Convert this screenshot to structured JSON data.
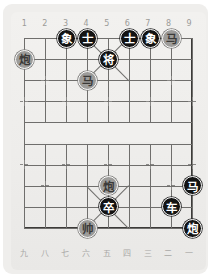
{
  "board": {
    "title": "Xiangqi Board",
    "columns": 9,
    "rows": 10,
    "colors": {
      "card_background": "#efeeec",
      "paper_background": "#f1f0ee",
      "grid_line": "#6f6e6c",
      "frame": "#3c3b39",
      "black_piece_fill": "#131313",
      "black_piece_text": "#ffffff",
      "grey_piece_fill": "#9d9c9a",
      "grey_piece_text": "#3b3a38",
      "coord_text": "#9c9b99"
    },
    "coords_top": [
      "1",
      "2",
      "3",
      "4",
      "5",
      "6",
      "7",
      "8",
      "9"
    ],
    "coords_bottom": [
      "九",
      "八",
      "七",
      "六",
      "五",
      "四",
      "三",
      "二",
      "一"
    ],
    "pieces": [
      {
        "label": "象",
        "side": "black",
        "file": 3,
        "rank": 0,
        "name": "elephant-black-file3"
      },
      {
        "label": "士",
        "side": "black",
        "file": 4,
        "rank": 0,
        "name": "advisor-black-file4"
      },
      {
        "label": "士",
        "side": "black",
        "file": 6,
        "rank": 0,
        "name": "advisor-black-file6"
      },
      {
        "label": "象",
        "side": "black",
        "file": 7,
        "rank": 0,
        "name": "elephant-black-file7"
      },
      {
        "label": "马",
        "side": "grey",
        "file": 8,
        "rank": 0,
        "name": "horse-grey-file8"
      },
      {
        "label": "炮",
        "side": "grey",
        "file": 1,
        "rank": 1,
        "name": "cannon-grey-file1"
      },
      {
        "label": "将",
        "side": "black",
        "file": 5,
        "rank": 1,
        "name": "general-black-file5"
      },
      {
        "label": "马",
        "side": "grey",
        "file": 4,
        "rank": 2,
        "name": "horse-grey-file4"
      },
      {
        "label": "炮",
        "side": "grey",
        "file": 5,
        "rank": 7,
        "name": "cannon-grey-file5"
      },
      {
        "label": "马",
        "side": "black",
        "file": 9,
        "rank": 7,
        "name": "horse-black-file9"
      },
      {
        "label": "卒",
        "side": "black",
        "file": 5,
        "rank": 8,
        "name": "pawn-black-file5"
      },
      {
        "label": "车",
        "side": "black",
        "file": 8,
        "rank": 8,
        "name": "chariot-black-file8"
      },
      {
        "label": "帅",
        "side": "grey",
        "file": 4,
        "rank": 9,
        "name": "marshal-grey-file4"
      },
      {
        "label": "炮",
        "side": "black",
        "file": 9,
        "rank": 9,
        "name": "cannon-black-file9"
      }
    ],
    "star_points": [
      {
        "file": 2,
        "rank": 2
      },
      {
        "file": 8,
        "rank": 2
      },
      {
        "file": 1,
        "rank": 3
      },
      {
        "file": 3,
        "rank": 3
      },
      {
        "file": 5,
        "rank": 3
      },
      {
        "file": 7,
        "rank": 3
      },
      {
        "file": 9,
        "rank": 3
      },
      {
        "file": 1,
        "rank": 6
      },
      {
        "file": 3,
        "rank": 6
      },
      {
        "file": 5,
        "rank": 6
      },
      {
        "file": 7,
        "rank": 6
      },
      {
        "file": 9,
        "rank": 6
      },
      {
        "file": 2,
        "rank": 7
      },
      {
        "file": 8,
        "rank": 7
      }
    ]
  }
}
